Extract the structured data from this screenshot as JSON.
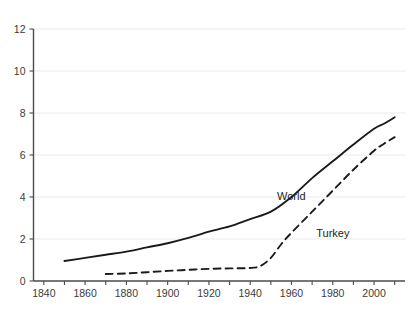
{
  "chart_data": {
    "type": "line",
    "title": "",
    "subtitle": "",
    "xlabel": "",
    "ylabel": "",
    "xlim": [
      1835,
      2015
    ],
    "ylim": [
      0,
      12
    ],
    "grid": true,
    "grid_axis": "y",
    "legend_position": "inline-annotation",
    "x_ticks": [
      1840,
      1860,
      1880,
      1900,
      1920,
      1940,
      1960,
      1980,
      2000
    ],
    "x_tick_labels": [
      "1840",
      "1860",
      "1880",
      "1900",
      "1920",
      "1940",
      "1960",
      "1980",
      "2000"
    ],
    "x_minor_ticks": [
      1850,
      1870,
      1890,
      1910,
      1930,
      1950,
      1970,
      1990,
      2010
    ],
    "y_ticks": [
      0,
      2,
      4,
      6,
      8,
      10,
      12
    ],
    "y_tick_labels": [
      "0",
      "2",
      "4",
      "6",
      "8",
      "10",
      "12"
    ],
    "series": [
      {
        "name": "World",
        "style": "solid",
        "color": "#1a1a1a",
        "label_x": 1953,
        "label_y": 3.85,
        "x": [
          1850,
          1860,
          1870,
          1880,
          1890,
          1900,
          1910,
          1920,
          1930,
          1940,
          1950,
          1960,
          1970,
          1980,
          1990,
          2000,
          2005,
          2010
        ],
        "y": [
          0.95,
          1.1,
          1.25,
          1.4,
          1.6,
          1.8,
          2.05,
          2.35,
          2.6,
          2.95,
          3.3,
          4.0,
          4.9,
          5.7,
          6.5,
          7.25,
          7.5,
          7.8
        ]
      },
      {
        "name": "Turkey",
        "style": "dashed",
        "color": "#1a1a1a",
        "label_x": 1972,
        "label_y": 2.1,
        "x": [
          1870,
          1880,
          1890,
          1900,
          1910,
          1920,
          1930,
          1940,
          1945,
          1950,
          1955,
          1960,
          1970,
          1980,
          1990,
          2000,
          2005,
          2010
        ],
        "y": [
          0.33,
          0.36,
          0.42,
          0.48,
          0.53,
          0.58,
          0.6,
          0.62,
          0.72,
          1.1,
          1.75,
          2.3,
          3.3,
          4.3,
          5.3,
          6.2,
          6.55,
          6.85
        ]
      }
    ]
  },
  "annotations": {
    "world_label": "World",
    "turkey_label": "Turkey"
  }
}
